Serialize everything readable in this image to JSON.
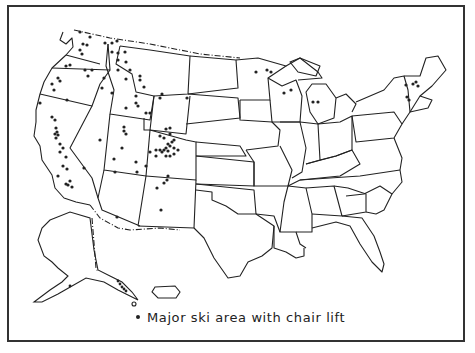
{
  "map": {
    "title": "",
    "region": "United States (contiguous, Alaska, Hawaii)",
    "legend": {
      "symbol": "dot",
      "label": "Major ski area with chair lift"
    },
    "colors": {
      "outline": "#222222",
      "dots": "#222222",
      "background": "#ffffff"
    },
    "ski_area_clusters": [
      {
        "region": "Washington",
        "count": 9
      },
      {
        "region": "Oregon",
        "count": 8
      },
      {
        "region": "Idaho",
        "count": 9
      },
      {
        "region": "Montana",
        "count": 10
      },
      {
        "region": "Wyoming",
        "count": 7
      },
      {
        "region": "California",
        "count": 20
      },
      {
        "region": "Nevada",
        "count": 3
      },
      {
        "region": "Utah",
        "count": 9
      },
      {
        "region": "Colorado",
        "count": 22
      },
      {
        "region": "Arizona",
        "count": 3
      },
      {
        "region": "New Mexico",
        "count": 6
      },
      {
        "region": "Minnesota",
        "count": 3
      },
      {
        "region": "Wisconsin",
        "count": 2
      },
      {
        "region": "Michigan",
        "count": 3
      },
      {
        "region": "Vermont",
        "count": 4
      },
      {
        "region": "New Hampshire",
        "count": 4
      }
    ]
  }
}
